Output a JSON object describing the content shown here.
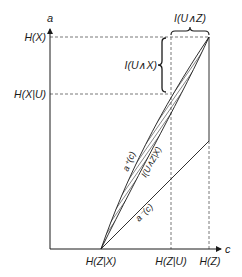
{
  "diagram": {
    "axes": {
      "y_label": "a",
      "x_label": "c"
    },
    "y_ticks": [
      {
        "label": "H(X)",
        "level": "top"
      },
      {
        "label": "H(X|U)",
        "level": "mid"
      }
    ],
    "x_ticks": [
      {
        "label": "H(Z|X)"
      },
      {
        "label": "H(Z|U)"
      },
      {
        "label": "H(Z)"
      }
    ],
    "braces": {
      "horizontal": "I(U∧Z)",
      "vertical": "I(U∧X)"
    },
    "curves": {
      "upper": "a⁺(c)",
      "lower": "a⁻(c)",
      "region": "I(U∧Z|X)"
    },
    "colors": {
      "line": "#1a1a1a",
      "dash": "#555555",
      "hatch": "#222222",
      "background": "#ffffff"
    }
  }
}
